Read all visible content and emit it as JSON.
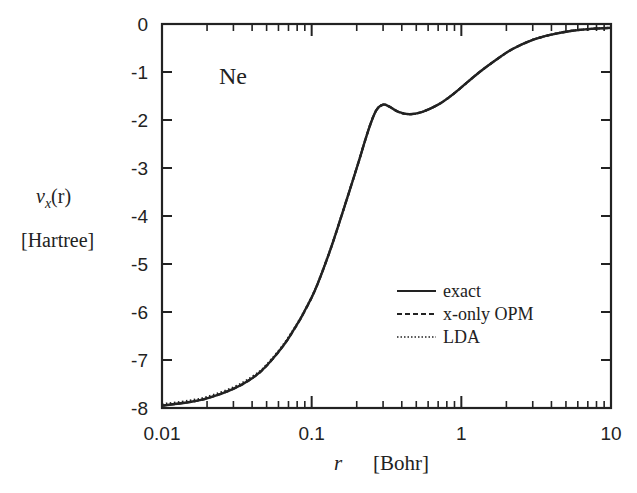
{
  "chart_data": {
    "type": "line",
    "title": "",
    "annotation": "Ne",
    "xlabel": "r",
    "xlabel_unit": "[Bohr]",
    "ylabel": "v_x(r)",
    "ylabel_unit": "[Hartree]",
    "xscale": "log",
    "xlim": [
      0.01,
      10
    ],
    "ylim": [
      -8,
      0
    ],
    "x_ticks": [
      0.01,
      0.1,
      1,
      10
    ],
    "x_tick_labels": [
      "0.01",
      "0.1",
      "1",
      "10"
    ],
    "y_ticks": [
      0,
      -1,
      -2,
      -3,
      -4,
      -5,
      -6,
      -7,
      -8
    ],
    "y_tick_labels": [
      "0",
      "-1",
      "-2",
      "-3",
      "-4",
      "-5",
      "-6",
      "-7",
      "-8"
    ],
    "grid": false,
    "legend_position": "lower right",
    "x": [
      0.01,
      0.015,
      0.02,
      0.03,
      0.04,
      0.05,
      0.07,
      0.1,
      0.13,
      0.16,
      0.2,
      0.24,
      0.27,
      0.3,
      0.33,
      0.38,
      0.45,
      0.55,
      0.7,
      0.85,
      1.0,
      1.3,
      1.7,
      2.2,
      3.0,
      4.0,
      5.5,
      7.5,
      10
    ],
    "series": [
      {
        "name": "exact",
        "style": "solid",
        "values": [
          -7.95,
          -7.88,
          -7.8,
          -7.6,
          -7.38,
          -7.12,
          -6.55,
          -5.7,
          -4.8,
          -3.95,
          -3.0,
          -2.2,
          -1.8,
          -1.68,
          -1.72,
          -1.83,
          -1.88,
          -1.83,
          -1.68,
          -1.5,
          -1.32,
          -1.02,
          -0.75,
          -0.52,
          -0.33,
          -0.22,
          -0.14,
          -0.1,
          -0.08
        ]
      },
      {
        "name": "x-only OPM",
        "style": "dashed",
        "values": [
          -7.95,
          -7.88,
          -7.8,
          -7.6,
          -7.38,
          -7.12,
          -6.55,
          -5.7,
          -4.8,
          -3.95,
          -3.0,
          -2.2,
          -1.8,
          -1.68,
          -1.72,
          -1.83,
          -1.88,
          -1.83,
          -1.68,
          -1.5,
          -1.32,
          -1.02,
          -0.75,
          -0.52,
          -0.33,
          -0.22,
          -0.14,
          -0.1,
          -0.08
        ]
      },
      {
        "name": "LDA",
        "style": "dotted",
        "values": [
          -7.92,
          -7.85,
          -7.77,
          -7.57,
          -7.35,
          -7.1,
          -6.53,
          -5.69,
          -4.79,
          -3.95,
          -3.0,
          -2.2,
          -1.8,
          -1.68,
          -1.72,
          -1.83,
          -1.88,
          -1.83,
          -1.68,
          -1.5,
          -1.32,
          -1.02,
          -0.75,
          -0.52,
          -0.33,
          -0.22,
          -0.14,
          -0.1,
          -0.08
        ]
      }
    ]
  },
  "labels": {
    "element": "Ne",
    "ylabel_symbol": "v",
    "ylabel_sub": "x",
    "ylabel_arg": "(r)",
    "ylabel_unit": "[Hartree]",
    "xlabel_symbol": "r",
    "xlabel_unit": "[Bohr]"
  },
  "legend": [
    {
      "label": "exact",
      "style": "solid"
    },
    {
      "label": "x-only OPM",
      "style": "dashed"
    },
    {
      "label": "LDA",
      "style": "dotted"
    }
  ],
  "colors": {
    "line": "#222222",
    "axis": "#222222",
    "background": "#ffffff"
  }
}
